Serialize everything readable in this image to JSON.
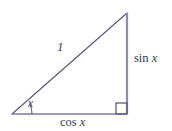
{
  "figure": {
    "type": "geometry-diagram",
    "background_color": "#ffffff",
    "stroke_color": "#5a5a7d",
    "text_color": "#3a3a52",
    "stroke_width": 1.2,
    "vertices": {
      "left": {
        "x": 12,
        "y": 114
      },
      "right_angle": {
        "x": 127,
        "y": 114
      },
      "top": {
        "x": 127,
        "y": 13
      }
    },
    "labels": {
      "hypotenuse": "1",
      "opposite": "sin x",
      "opposite_function": "sin",
      "opposite_variable": "x",
      "adjacent": "cos x",
      "adjacent_function": "cos",
      "adjacent_variable": "x",
      "angle": "x"
    },
    "markers": {
      "right_angle_marker": "right-angle-square",
      "angle_arc": "angle-arc"
    }
  }
}
